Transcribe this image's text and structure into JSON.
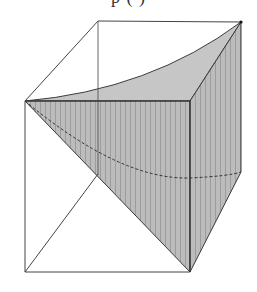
{
  "figure": {
    "caption_partial": "       p (          )",
    "colors": {
      "edge": "#3a3a3a",
      "light_edge": "#555555",
      "fill_top": "#c4c4c4",
      "fill_side": "#b8b8b8",
      "stripe": "#9e9e9e",
      "background": "#ffffff"
    },
    "vertices": {
      "front_top_left": [
        25,
        101
      ],
      "front_top_right": [
        190,
        101
      ],
      "front_bottom_left": [
        25,
        272
      ],
      "front_bottom_right": [
        190,
        272
      ],
      "back_top_left": [
        98,
        21
      ],
      "back_top_right": [
        241,
        22
      ],
      "back_bottom_left": [
        98,
        192
      ],
      "back_bottom_right": [
        241,
        172
      ]
    }
  }
}
